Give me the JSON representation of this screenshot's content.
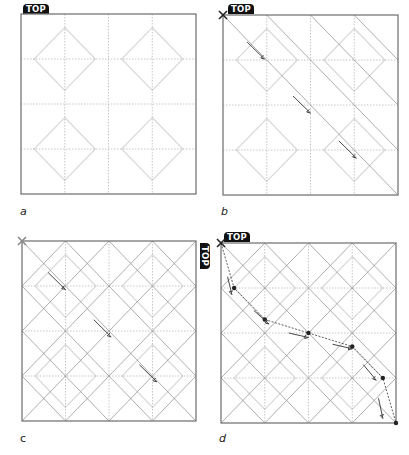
{
  "figure": {
    "grid_divisions": 4,
    "colors": {
      "frame": "#777777",
      "grid_dotted": "#b8b8b8",
      "diamond": "#d9d9d9",
      "fold_line": "#8a8a8a",
      "arrow": "#333333",
      "badge_bg": "#111111",
      "badge_text": "#ffffff",
      "x_mark_dark": "#222222",
      "x_mark_gray": "#888888",
      "path_point": "#222222"
    },
    "panels": [
      {
        "id": "a",
        "caption": "a",
        "caption_style": "italic",
        "badge": "TOP",
        "badge_position": "top-left",
        "corner_mark": "none",
        "fold_lines": "none",
        "arrows": []
      },
      {
        "id": "b",
        "caption": "b",
        "caption_style": "italic",
        "badge": "TOP",
        "badge_position": "top-left",
        "corner_mark": "x-dark",
        "fold_lines": "diagonal-down-upper",
        "arrows": [
          [
            0.9,
            0.9
          ],
          [
            1.95,
            2.1
          ],
          [
            3.0,
            3.1
          ]
        ]
      },
      {
        "id": "c",
        "caption": "c",
        "caption_style": "normal",
        "badge": "TOP",
        "badge_position": "right-rotated",
        "corner_mark": "x-gray",
        "fold_lines": "diagonal-both",
        "arrows": [
          [
            0.95,
            1.0
          ],
          [
            2.0,
            2.05
          ],
          [
            3.05,
            3.05
          ]
        ]
      },
      {
        "id": "d",
        "caption": "d",
        "caption_style": "italic",
        "badge": "TOP",
        "badge_position": "top-left",
        "corner_mark": "x-dark",
        "fold_lines": "diagonal-both",
        "path_points": [
          [
            0,
            0
          ],
          [
            0.3,
            1.0
          ],
          [
            1.0,
            1.7
          ],
          [
            2.0,
            2.0
          ],
          [
            3.0,
            2.3
          ],
          [
            3.7,
            3.0
          ],
          [
            4.0,
            4.0
          ]
        ],
        "path_arrows": [
          [
            0.15,
            0.75,
            0.1,
            0.4
          ],
          [
            0.75,
            1.5,
            0.35,
            0.3
          ],
          [
            1.55,
            2.0,
            0.45,
            0.1
          ],
          [
            2.55,
            2.25,
            0.45,
            0.1
          ],
          [
            3.25,
            2.7,
            0.3,
            0.35
          ],
          [
            3.6,
            3.45,
            0.1,
            0.45
          ]
        ]
      }
    ]
  }
}
